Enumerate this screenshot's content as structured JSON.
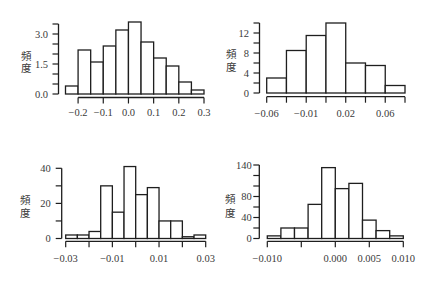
{
  "figure": {
    "panel_count": 4,
    "colors": {
      "bar_fill": "#ffffff",
      "bar_stroke": "#1e1e1e",
      "text": "#3a3a3a",
      "background": "#ffffff"
    }
  },
  "chart_data": [
    {
      "type": "bar",
      "subtype": "histogram",
      "title": "",
      "xlabel": "",
      "ylabel": "頻度",
      "ylabel_chars": [
        "頻",
        "度"
      ],
      "bin_edges": [
        -0.25,
        -0.2,
        -0.15,
        -0.1,
        -0.05,
        0.0,
        0.05,
        0.1,
        0.15,
        0.2,
        0.25,
        0.3
      ],
      "values": [
        0.4,
        2.2,
        1.6,
        2.4,
        3.2,
        3.6,
        2.6,
        1.8,
        1.4,
        0.6,
        0.2
      ],
      "xlim": [
        -0.25,
        0.3
      ],
      "ylim": [
        0,
        3.5
      ],
      "xticks": [
        -0.2,
        -0.1,
        0.0,
        0.1,
        0.2,
        0.3
      ],
      "xtick_labels": [
        {
          "value": -0.2,
          "label": "−0.2"
        },
        {
          "value": -0.1,
          "label": "−0.1"
        },
        {
          "value": 0.0,
          "label": "0.0"
        },
        {
          "value": 0.1,
          "label": "0.1"
        },
        {
          "value": 0.2,
          "label": "0.2"
        },
        {
          "value": 0.3,
          "label": "0.3"
        }
      ],
      "yticks": [
        0,
        0.5,
        1.0,
        1.5,
        2.0,
        2.5,
        3.0,
        3.5
      ],
      "ytick_labels": [
        {
          "value": 0,
          "label": "0.0"
        },
        {
          "value": 1.5,
          "label": "1.5"
        },
        {
          "value": 3.0,
          "label": "3.0"
        }
      ],
      "grid": false,
      "legend": null
    },
    {
      "type": "bar",
      "subtype": "histogram",
      "title": "",
      "xlabel": "",
      "ylabel": "頻度",
      "ylabel_chars": [
        "頻",
        "度"
      ],
      "bin_edges": [
        -0.06,
        -0.04,
        -0.02,
        0.0,
        0.02,
        0.04,
        0.06,
        0.08
      ],
      "values": [
        3.0,
        8.5,
        11.5,
        14.0,
        6.0,
        5.5,
        1.5
      ],
      "xlim": [
        -0.06,
        0.08
      ],
      "ylim": [
        0,
        14
      ],
      "xticks": [
        -0.06,
        -0.04,
        -0.02,
        0.0,
        0.02,
        0.04,
        0.06,
        0.08
      ],
      "xtick_labels": [
        {
          "value": -0.06,
          "label": "−0.06"
        },
        {
          "value": -0.02,
          "label": "−0.01"
        },
        {
          "value": 0.02,
          "label": "0.02"
        },
        {
          "value": 0.06,
          "label": "0.06"
        }
      ],
      "yticks": [
        0,
        2,
        4,
        6,
        8,
        10,
        12,
        14
      ],
      "ytick_labels": [
        {
          "value": 0,
          "label": "0"
        },
        {
          "value": 4,
          "label": "4"
        },
        {
          "value": 8,
          "label": "8"
        },
        {
          "value": 12,
          "label": "12"
        }
      ],
      "grid": false,
      "legend": null
    },
    {
      "type": "bar",
      "subtype": "histogram",
      "title": "",
      "xlabel": "",
      "ylabel": "頻度",
      "ylabel_chars": [
        "頻",
        "度"
      ],
      "bin_edges": [
        -0.03,
        -0.025,
        -0.02,
        -0.015,
        -0.01,
        -0.005,
        0.0,
        0.005,
        0.01,
        0.015,
        0.02,
        0.025,
        0.03
      ],
      "values": [
        2,
        2,
        4,
        30,
        15,
        41,
        25,
        29,
        10,
        10,
        1,
        2
      ],
      "xlim": [
        -0.03,
        0.03
      ],
      "ylim": [
        0,
        40
      ],
      "xticks": [
        -0.03,
        -0.02,
        -0.01,
        0.0,
        0.01,
        0.02,
        0.03
      ],
      "xtick_labels": [
        {
          "value": -0.03,
          "label": "−0.03"
        },
        {
          "value": -0.01,
          "label": "−0.01"
        },
        {
          "value": 0.01,
          "label": "0.01"
        },
        {
          "value": 0.03,
          "label": "0.03"
        }
      ],
      "yticks": [
        0,
        10,
        20,
        30,
        40
      ],
      "ytick_labels": [
        {
          "value": 0,
          "label": "0"
        },
        {
          "value": 20,
          "label": "20"
        },
        {
          "value": 40,
          "label": "40"
        }
      ],
      "grid": false,
      "legend": null
    },
    {
      "type": "bar",
      "subtype": "histogram",
      "title": "",
      "xlabel": "",
      "ylabel": "頻度",
      "ylabel_chars": [
        "頻",
        "度"
      ],
      "bin_edges": [
        -0.01,
        -0.008,
        -0.006,
        -0.004,
        -0.002,
        0.0,
        0.002,
        0.004,
        0.006,
        0.008,
        0.01
      ],
      "values": [
        5,
        20,
        20,
        65,
        135,
        95,
        105,
        35,
        15,
        5
      ],
      "xlim": [
        -0.01,
        0.01
      ],
      "ylim": [
        0,
        140
      ],
      "xticks": [
        -0.01,
        -0.005,
        0.0,
        0.005,
        0.01
      ],
      "xtick_labels": [
        {
          "value": -0.01,
          "label": "−0.010"
        },
        {
          "value": 0.0,
          "label": "0.000"
        },
        {
          "value": 0.005,
          "label": "0.005"
        },
        {
          "value": 0.01,
          "label": "0.010"
        }
      ],
      "yticks": [
        0,
        20,
        40,
        60,
        80,
        100,
        120,
        140
      ],
      "ytick_labels": [
        {
          "value": 0,
          "label": "0"
        },
        {
          "value": 40,
          "label": "40"
        },
        {
          "value": 80,
          "label": "80"
        },
        {
          "value": 140,
          "label": "140"
        }
      ],
      "grid": false,
      "legend": null
    }
  ]
}
